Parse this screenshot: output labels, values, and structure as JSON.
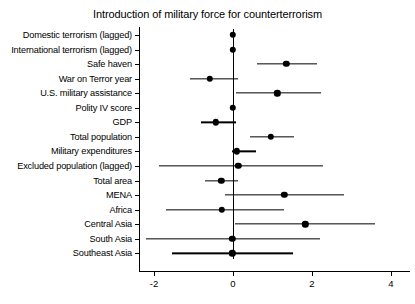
{
  "chart_data": {
    "type": "scatter",
    "title": "Introduction of military force for counterterrorism",
    "xlabel": "",
    "ylabel": "",
    "xlim": [
      -2.6,
      4.2
    ],
    "grid": false,
    "legend": null,
    "xticks": [
      -2,
      0,
      2,
      4
    ],
    "xticklabels": [
      "-2",
      "0",
      "2",
      "4"
    ],
    "zero_reference_line": 0,
    "categories": [
      "Domestic terrorism (lagged)",
      "International terrorism (lagged)",
      "Safe haven",
      "War on Terror year",
      "U.S. military assistance",
      "Polity IV score",
      "GDP",
      "Total population",
      "Military expenditures",
      "Excluded population (lagged)",
      "Total area",
      "MENA",
      "Africa",
      "Central Asia",
      "South Asia",
      "Southeast Asia"
    ],
    "series": [
      {
        "name": "Coefficient estimate",
        "values": [
          0.0,
          0.0,
          1.35,
          -0.58,
          1.12,
          0.0,
          -0.43,
          0.95,
          0.1,
          0.13,
          -0.3,
          1.3,
          -0.28,
          1.83,
          -0.02,
          -0.02
        ],
        "ci_low": [
          -0.05,
          -0.05,
          0.62,
          -1.1,
          0.08,
          -0.05,
          -0.82,
          0.43,
          -0.02,
          -1.88,
          -0.72,
          -0.2,
          -1.7,
          0.06,
          -2.2,
          -1.55
        ],
        "ci_high": [
          0.05,
          0.05,
          2.12,
          0.12,
          2.22,
          0.06,
          0.08,
          1.55,
          0.58,
          2.28,
          0.12,
          2.82,
          1.3,
          3.6,
          2.2,
          1.52
        ]
      }
    ]
  },
  "style": {
    "point_color": "#000000",
    "line_color": "#000000",
    "axis_color": "#000000",
    "background": "#ffffff"
  }
}
